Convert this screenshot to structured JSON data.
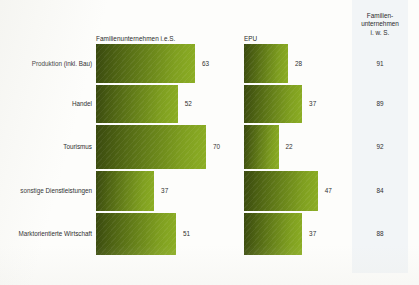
{
  "chart_data": {
    "type": "bar",
    "orientation": "horizontal",
    "title": "",
    "xlabel": "",
    "ylabel": "",
    "grid": false,
    "legend_position": "column-headers",
    "categories": [
      "Produktion (inkl. Bau)",
      "Handel",
      "Tourismus",
      "sonstige Dienstleistungen",
      "Marktorientierte Wirtschaft"
    ],
    "series": [
      {
        "name": "Familienunternehmen i.e.S.",
        "type": "bar",
        "values": [
          63,
          52,
          70,
          37,
          51
        ]
      },
      {
        "name": "EPU",
        "type": "bar",
        "values": [
          28,
          37,
          22,
          47,
          37
        ]
      },
      {
        "name": "Familien- unternehmen i. w. S.",
        "type": "table",
        "values": [
          91,
          89,
          92,
          84,
          88
        ]
      }
    ],
    "xlim": [
      0,
      70
    ],
    "value_unit": "%",
    "colors": {
      "bar_dark": "#39490f",
      "bar_light": "#8cae24",
      "panel_tint": "#f2f5f7",
      "background": "#fdfdfb",
      "text": "#2e2e2e"
    }
  },
  "headers": {
    "series1": "Familienunternehmen i.e.S.",
    "series2": "EPU",
    "col3_line1": "Familien-",
    "col3_line2": "unternehmen",
    "col3_line3": "i. w. S."
  },
  "rows": [
    {
      "label": "Produktion (inkl. Bau)",
      "v1": "63",
      "v2": "28",
      "v3": "91"
    },
    {
      "label": "Handel",
      "v1": "52",
      "v2": "37",
      "v3": "89"
    },
    {
      "label": "Tourismus",
      "v1": "70",
      "v2": "22",
      "v3": "92"
    },
    {
      "label": "sonstige Dienstleistungen",
      "v1": "37",
      "v2": "47",
      "v3": "84"
    },
    {
      "label": "Marktorientierte Wirtschaft",
      "v1": "51",
      "v2": "37",
      "v3": "88"
    }
  ]
}
